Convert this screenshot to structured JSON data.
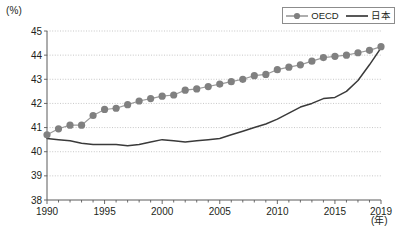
{
  "chart_data": {
    "type": "line",
    "title": "",
    "xlabel": "(年)",
    "ylabel": "(%)",
    "yunit": "(%)",
    "xunit": "(年)",
    "xlim": [
      1990,
      2019
    ],
    "ylim": [
      38,
      45
    ],
    "grid": true,
    "legend_position": "top-right",
    "x": [
      1990,
      1991,
      1992,
      1993,
      1994,
      1995,
      1996,
      1997,
      1998,
      1999,
      2000,
      2001,
      2002,
      2003,
      2004,
      2005,
      2006,
      2007,
      2008,
      2009,
      2010,
      2011,
      2012,
      2013,
      2014,
      2015,
      2016,
      2017,
      2018,
      2019
    ],
    "xtick_labels": [
      "1990",
      "1995",
      "2000",
      "2005",
      "2010",
      "2015",
      "2019"
    ],
    "xtick_values": [
      1990,
      1995,
      2000,
      2005,
      2010,
      2015,
      2019
    ],
    "ytick_labels": [
      "38",
      "39",
      "40",
      "41",
      "42",
      "43",
      "44",
      "45"
    ],
    "ytick_values": [
      38,
      39,
      40,
      41,
      42,
      43,
      44,
      45
    ],
    "series": [
      {
        "name": "OECD",
        "marker": "circle",
        "color": "#808080",
        "values": [
          40.7,
          40.95,
          41.1,
          41.1,
          41.5,
          41.75,
          41.8,
          41.95,
          42.1,
          42.2,
          42.3,
          42.35,
          42.55,
          42.6,
          42.7,
          42.8,
          42.9,
          43.0,
          43.15,
          43.2,
          43.4,
          43.5,
          43.6,
          43.75,
          43.9,
          43.95,
          44.0,
          44.1,
          44.2,
          44.35
        ]
      },
      {
        "name": "日本",
        "marker": "none",
        "color": "#3a3a3a",
        "values": [
          40.55,
          40.5,
          40.45,
          40.35,
          40.3,
          40.3,
          40.3,
          40.25,
          40.3,
          40.4,
          40.5,
          40.45,
          40.4,
          40.45,
          40.5,
          40.55,
          40.7,
          40.85,
          41.0,
          41.15,
          41.35,
          41.6,
          41.85,
          42.0,
          42.2,
          42.25,
          42.5,
          42.95,
          43.6,
          44.3
        ]
      }
    ]
  },
  "legend": {
    "items": [
      {
        "label": "OECD",
        "style": "marker-line"
      },
      {
        "label": "日本",
        "style": "line"
      }
    ]
  }
}
